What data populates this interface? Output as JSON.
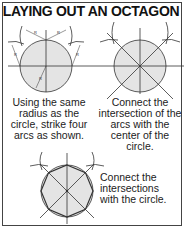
{
  "title": "LAYING OUT AN OCTAGON",
  "steps": [
    {
      "caption": "Using the same radius as the circle, strike four arcs as shown.",
      "label": "R"
    },
    {
      "caption": "Connect the intersection of the arcs with the center of the circle."
    },
    {
      "caption": "Connect the intersections with the circle."
    }
  ],
  "colors": {
    "fill": "#e4e4e4",
    "line": "#333333"
  }
}
